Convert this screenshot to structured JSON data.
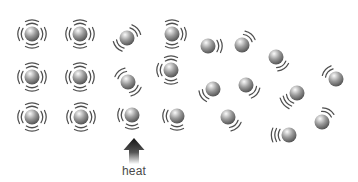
{
  "diagram": {
    "type": "particle-vibration-heat",
    "canvas": {
      "width": 358,
      "height": 182,
      "background": "#ffffff"
    },
    "sphere": {
      "radius": 7.5,
      "highlight_color": "#fbfbfb",
      "mid_color": "#9a9a9a",
      "edge_color": "#3c3c3c"
    },
    "arc": {
      "color": "#4f4f4f",
      "stroke_width": 1.25,
      "inner_radius": 10.6,
      "spacing": 3.5,
      "span_deg": 64,
      "span_step_deg": 9
    },
    "particles": [
      {
        "x": 32,
        "y": 34,
        "arcs": [
          {
            "dir": 180,
            "n": 2
          },
          {
            "dir": 0,
            "n": 2
          },
          {
            "dir": 270,
            "n": 2
          },
          {
            "dir": 90,
            "n": 2
          }
        ]
      },
      {
        "x": 80,
        "y": 34,
        "arcs": [
          {
            "dir": 180,
            "n": 2
          },
          {
            "dir": 0,
            "n": 2
          },
          {
            "dir": 270,
            "n": 2
          },
          {
            "dir": 90,
            "n": 2
          }
        ]
      },
      {
        "x": 32,
        "y": 77,
        "arcs": [
          {
            "dir": 180,
            "n": 2
          },
          {
            "dir": 0,
            "n": 2
          },
          {
            "dir": 270,
            "n": 2
          },
          {
            "dir": 90,
            "n": 2
          }
        ]
      },
      {
        "x": 80,
        "y": 77,
        "arcs": [
          {
            "dir": 180,
            "n": 2
          },
          {
            "dir": 0,
            "n": 2
          },
          {
            "dir": 270,
            "n": 2
          },
          {
            "dir": 90,
            "n": 2
          }
        ]
      },
      {
        "x": 32,
        "y": 117,
        "arcs": [
          {
            "dir": 180,
            "n": 2
          },
          {
            "dir": 0,
            "n": 2
          },
          {
            "dir": 270,
            "n": 2
          },
          {
            "dir": 90,
            "n": 2
          }
        ]
      },
      {
        "x": 81,
        "y": 117,
        "arcs": [
          {
            "dir": 180,
            "n": 2
          },
          {
            "dir": 0,
            "n": 2
          },
          {
            "dir": 270,
            "n": 2
          },
          {
            "dir": 90,
            "n": 2
          }
        ]
      },
      {
        "x": 127,
        "y": 38,
        "arcs": [
          {
            "dir": 318,
            "n": 2
          },
          {
            "dir": 138,
            "n": 2
          }
        ]
      },
      {
        "x": 128,
        "y": 82,
        "arcs": [
          {
            "dir": 230,
            "n": 2
          },
          {
            "dir": 50,
            "n": 2
          }
        ]
      },
      {
        "x": 132,
        "y": 115,
        "arcs": [
          {
            "dir": 180,
            "n": 2
          },
          {
            "dir": 90,
            "n": 2
          }
        ]
      },
      {
        "x": 172,
        "y": 34,
        "arcs": [
          {
            "dir": 270,
            "n": 2
          },
          {
            "dir": 0,
            "n": 2
          },
          {
            "dir": 90,
            "n": 2
          }
        ]
      },
      {
        "x": 171,
        "y": 70,
        "arcs": [
          {
            "dir": 180,
            "n": 2
          },
          {
            "dir": 270,
            "n": 2
          },
          {
            "dir": 90,
            "n": 2
          }
        ]
      },
      {
        "x": 177,
        "y": 116,
        "arcs": [
          {
            "dir": 180,
            "n": 2
          },
          {
            "dir": 90,
            "n": 2
          }
        ]
      },
      {
        "x": 208,
        "y": 46,
        "arcs": [
          {
            "dir": 0,
            "n": 2
          }
        ]
      },
      {
        "x": 242,
        "y": 45,
        "arcs": [
          {
            "dir": 310,
            "n": 2
          }
        ]
      },
      {
        "x": 276,
        "y": 57,
        "arcs": [
          {
            "dir": 55,
            "n": 2
          }
        ]
      },
      {
        "x": 336,
        "y": 79,
        "arcs": [
          {
            "dir": 222,
            "n": 2
          }
        ]
      },
      {
        "x": 213,
        "y": 89,
        "arcs": [
          {
            "dir": 145,
            "n": 2
          }
        ]
      },
      {
        "x": 246,
        "y": 85,
        "arcs": [
          {
            "dir": 40,
            "n": 2
          }
        ]
      },
      {
        "x": 297,
        "y": 93,
        "arcs": [
          {
            "dir": 140,
            "n": 3
          }
        ]
      },
      {
        "x": 228,
        "y": 117,
        "arcs": [
          {
            "dir": 50,
            "n": 2
          }
        ]
      },
      {
        "x": 289,
        "y": 135,
        "arcs": [
          {
            "dir": 180,
            "n": 3
          }
        ]
      },
      {
        "x": 322,
        "y": 122,
        "arcs": [
          {
            "dir": 300,
            "n": 2
          }
        ]
      }
    ],
    "heat_arrow": {
      "label": "heat",
      "label_color": "#4a4a4a",
      "cx": 134,
      "apex_y": 138,
      "head_base_y": 150,
      "head_half_width": 10.5,
      "shaft_half_width": 5,
      "shaft_bottom_y": 164,
      "color_top": "#141414",
      "color_mid": "#555555",
      "color_bottom": "#fdfdfd"
    }
  }
}
